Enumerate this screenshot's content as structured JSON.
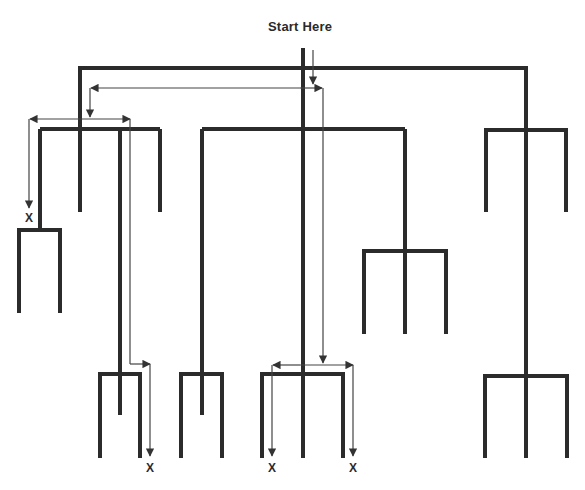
{
  "diagram": {
    "title": "Start Here",
    "dead_end_marker": "X",
    "dead_ends": [
      {
        "id": "left-upper",
        "x": 29,
        "y": 218
      },
      {
        "id": "left-bottom",
        "x": 150,
        "y": 468
      },
      {
        "id": "center-left",
        "x": 272,
        "y": 468
      },
      {
        "id": "center-right",
        "x": 353,
        "y": 468
      }
    ],
    "colors": {
      "tree": "#2b2b2b",
      "path": "#444444",
      "background": "#ffffff"
    }
  }
}
